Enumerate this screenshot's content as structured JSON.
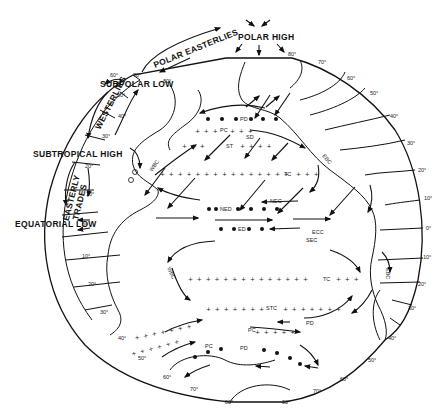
{
  "diagram": {
    "wind_belts": {
      "polar_high": "POLAR HIGH",
      "polar_easterlies": "POLAR EASTERLIES",
      "subpolar_low": "SUBPOLAR   LOW",
      "westerlies": "WESTERLIES",
      "subtropical_high": "SUBTROPICAL HIGH",
      "easterly_trades_1": "EASTERLY",
      "easterly_trades_2": "TRADES",
      "equatorial_low": "EQUATORIAL LOW"
    },
    "latitudes_left": [
      "80°",
      "70°",
      "60°",
      "50°",
      "40°",
      "30°",
      "20°",
      "10°",
      "0°",
      "10°",
      "20°",
      "30°",
      "40°",
      "50°",
      "60°",
      "70°",
      "80°"
    ],
    "latitudes_right": [
      "80°",
      "70°",
      "60°",
      "50°",
      "40°",
      "30°",
      "20°",
      "10°",
      "0°",
      "10°",
      "20°",
      "30°",
      "40°",
      "50°",
      "60°",
      "70°",
      "80°"
    ],
    "currents": {
      "pd_north": "PD",
      "pc_north": "PC",
      "sd": "SD",
      "st": "ST",
      "wbc_north": "WBC",
      "ebc_north": "EBC",
      "tc_north": "TC",
      "nec": "NEC",
      "ned": "NED",
      "ecc": "ECC",
      "ed": "ED",
      "sec": "SEC",
      "wbc_south": "WBC",
      "ebc_south": "EBC",
      "tc_south": "TC",
      "stc": "STC",
      "pd_south": "PD",
      "pc_south": "PC",
      "pd_south_2": "PD",
      "pc_south_2": "PC"
    },
    "legend_abbrev": {
      "PD": "Polar Divergence",
      "PC": "Polar Convergence",
      "STC": "Subtropical Convergence",
      "TC": "Tropical Convergence",
      "NEC": "North Equatorial Current",
      "NED": "North Equatorial Divergence",
      "ECC": "Equatorial Countercurrent",
      "ED": "Equatorial Divergence",
      "SEC": "South Equatorial Current",
      "WBC": "Western Boundary Current",
      "EBC": "Eastern Boundary Current"
    },
    "colors": {
      "ink": "#111111",
      "background": "#ffffff"
    }
  }
}
